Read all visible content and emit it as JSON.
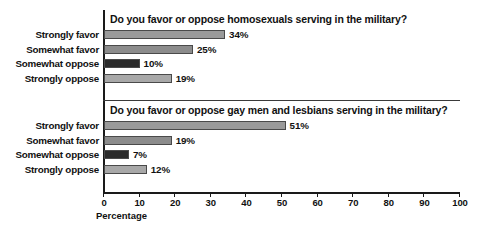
{
  "chart_data": {
    "type": "bar",
    "orientation": "horizontal",
    "title": "",
    "xlabel": "Percentage",
    "ylabel": "",
    "xlim": [
      0,
      100
    ],
    "xticks": [
      0,
      10,
      20,
      30,
      40,
      50,
      60,
      70,
      80,
      90,
      100
    ],
    "xtick_labels": [
      "0",
      "10",
      "20",
      "30",
      "40",
      "50",
      "60",
      "70",
      "80",
      "90",
      "100"
    ],
    "grid": false,
    "legend": false,
    "categories": [
      "Strongly favor",
      "Somewhat favor",
      "Somewhat oppose",
      "Strongly oppose"
    ],
    "panels": [
      {
        "title_prefix": "Do you favor or oppose ",
        "title_emphasis": "homosexuals",
        "title_suffix": " serving in the military?",
        "values": [
          34,
          25,
          10,
          19
        ],
        "value_labels": [
          "34%",
          "25%",
          "10%",
          "19%"
        ],
        "bar_colors": [
          "#9a9a9a",
          "#8c8c8c",
          "#2b2b2b",
          "#a8a8a8"
        ]
      },
      {
        "title_prefix": "Do you favor or oppose ",
        "title_emphasis": "gay men and lesbians",
        "title_suffix": " serving in the military?",
        "values": [
          51,
          19,
          7,
          12
        ],
        "value_labels": [
          "51%",
          "19%",
          "7%",
          "12%"
        ],
        "bar_colors": [
          "#9a9a9a",
          "#8c8c8c",
          "#2b2b2b",
          "#a8a8a8"
        ]
      }
    ]
  },
  "colors": {
    "axis": "#1a1a1a",
    "divider": "#3a3a3a",
    "text": "#111111",
    "background": "#ffffff",
    "bar_border": "#4a4a4a"
  }
}
